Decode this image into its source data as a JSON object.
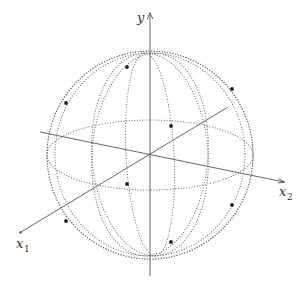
{
  "diagram": {
    "type": "3d-sphere-coordinate-diagram",
    "colors": {
      "axis": "#555555",
      "grid": "#6a6a6a",
      "point": "#222222",
      "background": "#ffffff"
    },
    "axes": {
      "y": {
        "label": "y",
        "from": [
          150,
          276
        ],
        "to": [
          150,
          12
        ]
      },
      "x1": {
        "label": "x",
        "subscript": "1",
        "from": [
          228,
          107
        ],
        "to": [
          20,
          233
        ]
      },
      "x2": {
        "label": "x",
        "subscript": "2",
        "from": [
          40,
          132
        ],
        "to": [
          285,
          182
        ]
      }
    },
    "origin": [
      150,
      155
    ],
    "sphere": {
      "center": [
        150,
        155
      ],
      "rx": 103,
      "ry": 102
    },
    "equator": {
      "rx": 103,
      "ry": 35
    },
    "points": [
      {
        "x": 66,
        "y": 103
      },
      {
        "x": 127,
        "y": 67
      },
      {
        "x": 232,
        "y": 89
      },
      {
        "x": 171,
        "y": 126
      },
      {
        "x": 66,
        "y": 221
      },
      {
        "x": 127,
        "y": 184
      },
      {
        "x": 232,
        "y": 205
      },
      {
        "x": 171,
        "y": 242
      }
    ]
  }
}
